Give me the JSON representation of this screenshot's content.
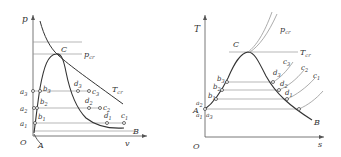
{
  "pv_diagram": {
    "axis_y": "p",
    "axis_x": "v",
    "origin": "O",
    "point_A": "A",
    "point_B": "B",
    "critical_point": "C",
    "critical_pressure": {
      "main": "p",
      "sub": "cr"
    },
    "critical_temperature": {
      "main": "T",
      "sub": "cr"
    },
    "points": {
      "a1": {
        "main": "a",
        "sub": "1"
      },
      "a2": {
        "main": "a",
        "sub": "2"
      },
      "a3": {
        "main": "a",
        "sub": "3"
      },
      "b1": {
        "main": "b",
        "sub": "1"
      },
      "b2": {
        "main": "b",
        "sub": "2"
      },
      "b3": {
        "main": "b",
        "sub": "3"
      },
      "c1": {
        "main": "c",
        "sub": "1"
      },
      "c2": {
        "main": "c",
        "sub": "2"
      },
      "c3": {
        "main": "c",
        "sub": "3"
      },
      "d1": {
        "main": "d",
        "sub": "1"
      },
      "d2": {
        "main": "d",
        "sub": "2"
      },
      "d3": {
        "main": "d",
        "sub": "3"
      }
    }
  },
  "ts_diagram": {
    "axis_y": "T",
    "axis_x": "s",
    "origin": "O",
    "point_A": "A",
    "point_B": "B",
    "critical_point": "C",
    "critical_pressure": {
      "main": "p",
      "sub": "cr"
    },
    "critical_temperature": {
      "main": "T",
      "sub": "cr"
    },
    "points": {
      "a1": {
        "main": "a",
        "sub": "1"
      },
      "a2": {
        "main": "a",
        "sub": "2"
      },
      "a3": {
        "main": "a",
        "sub": "3"
      },
      "b1": {
        "main": "b",
        "sub": "1"
      },
      "b2": {
        "main": "b",
        "sub": "2"
      },
      "b3": {
        "main": "b",
        "sub": "3"
      },
      "c1": {
        "main": "c",
        "sub": "1"
      },
      "c2": {
        "main": "c",
        "sub": "2"
      },
      "c3": {
        "main": "c",
        "sub": "3"
      },
      "d1": {
        "main": "d",
        "sub": "1"
      },
      "d2": {
        "main": "d",
        "sub": "2"
      },
      "d3": {
        "main": "d",
        "sub": "3"
      }
    }
  },
  "colors": {
    "axis": "#555555",
    "curve": "#333333",
    "thin_line": "#999999",
    "label": "#333333"
  }
}
